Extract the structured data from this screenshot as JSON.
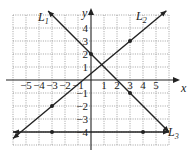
{
  "chart_data": {
    "type": "line",
    "title": "",
    "xlabel": "x",
    "ylabel": "y",
    "xlim": [
      -6,
      6
    ],
    "ylim": [
      -5,
      5
    ],
    "grid": true,
    "x_ticks": [
      "-5",
      "-4",
      "-3",
      "-2",
      "-1",
      "1",
      "2",
      "3",
      "4",
      "5"
    ],
    "y_ticks": [
      "4",
      "3",
      "2",
      "1",
      "-1",
      "-2",
      "-3",
      "-4"
    ],
    "series": [
      {
        "name": "L1",
        "equation": "y = -x + 2",
        "slope": -1,
        "intercept": 2,
        "marked_points": [
          [
            0,
            2
          ],
          [
            3,
            -1
          ]
        ],
        "x_range": [
          -3.3,
          6
        ]
      },
      {
        "name": "L2",
        "equation": "y = (5/6)x + 0.5",
        "slope": 0.8333,
        "intercept": 0.5,
        "marked_points": [
          [
            -3,
            -2
          ],
          [
            3,
            3
          ]
        ],
        "x_range": [
          -6,
          5.8
        ]
      },
      {
        "name": "L3",
        "equation": "y = -4",
        "slope": 0,
        "intercept": -4,
        "marked_points": [
          [
            -3,
            -4
          ],
          [
            4,
            -4
          ]
        ],
        "x_range": [
          -6,
          6
        ]
      }
    ],
    "legend": {
      "labels": [
        "L1",
        "L2",
        "L3"
      ],
      "position": "inline near line ends"
    }
  },
  "labels": {
    "x_axis": "x",
    "y_axis": "y",
    "L1": "L",
    "L1_sub": "1",
    "L2": "L",
    "L2_sub": "2",
    "L3": "L",
    "L3_sub": "3"
  }
}
